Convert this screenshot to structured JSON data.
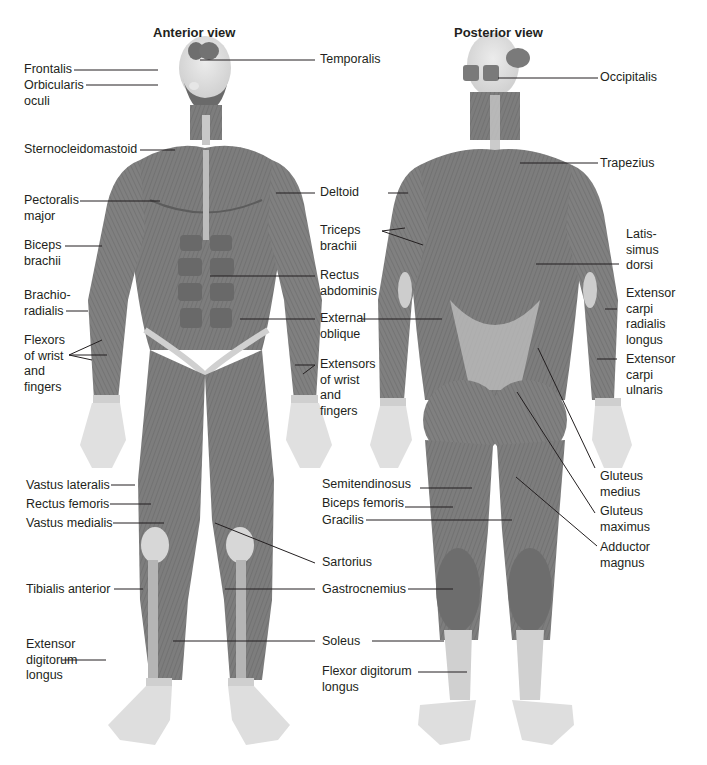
{
  "titles": {
    "anterior": "Anterior view",
    "posterior": "Posterior view"
  },
  "colors": {
    "muscle": "#7d7d7d",
    "muscle_dark": "#5e5e5e",
    "tendon": "#c9c9c9",
    "skin": "#e2e2e2",
    "text": "#231f20",
    "background": "#ffffff"
  },
  "anterior_labels": [
    {
      "id": "frontalis",
      "text": "Frontalis"
    },
    {
      "id": "orbicularis-oculi",
      "text": "Orbicularis\noculi"
    },
    {
      "id": "sternocleidomastoid",
      "text": "Sternocleidomastoid"
    },
    {
      "id": "pectoralis-major",
      "text": "Pectoralis\nmajor"
    },
    {
      "id": "biceps-brachii",
      "text": "Biceps\nbrachii"
    },
    {
      "id": "brachioradialis",
      "text": "Brachio-\nradialis"
    },
    {
      "id": "flexors-wrist-fingers",
      "text": "Flexors\nof wrist\nand\nfingers"
    },
    {
      "id": "vastus-lateralis",
      "text": "Vastus lateralis"
    },
    {
      "id": "rectus-femoris",
      "text": "Rectus femoris"
    },
    {
      "id": "vastus-medialis",
      "text": "Vastus medialis"
    },
    {
      "id": "tibialis-anterior",
      "text": "Tibialis anterior"
    },
    {
      "id": "extensor-digitorum-longus",
      "text": "Extensor\ndigitorum\nlongus"
    }
  ],
  "center_labels": [
    {
      "id": "temporalis",
      "text": "Temporalis"
    },
    {
      "id": "deltoid",
      "text": "Deltoid"
    },
    {
      "id": "triceps-brachii",
      "text": "Triceps\nbrachii"
    },
    {
      "id": "rectus-abdominis",
      "text": "Rectus\nabdominis"
    },
    {
      "id": "external-oblique",
      "text": "External\noblique"
    },
    {
      "id": "extensors-wrist-fingers",
      "text": "Extensors\nof wrist\nand\nfingers"
    },
    {
      "id": "semitendinosus",
      "text": "Semitendinosus"
    },
    {
      "id": "biceps-femoris",
      "text": "Biceps femoris"
    },
    {
      "id": "gracilis",
      "text": "Gracilis"
    },
    {
      "id": "sartorius",
      "text": "Sartorius"
    },
    {
      "id": "gastrocnemius",
      "text": "Gastrocnemius"
    },
    {
      "id": "soleus",
      "text": "Soleus"
    },
    {
      "id": "flexor-digitorum-longus",
      "text": "Flexor digitorum\nlongus"
    }
  ],
  "posterior_labels": [
    {
      "id": "occipitalis",
      "text": "Occipitalis"
    },
    {
      "id": "trapezius",
      "text": "Trapezius"
    },
    {
      "id": "latissimus-dorsi",
      "text": "Latis-\nsimus\ndorsi"
    },
    {
      "id": "extensor-carpi-radialis-longus",
      "text": "Extensor\ncarpi\nradialis\nlongus"
    },
    {
      "id": "extensor-carpi-ulnaris",
      "text": "Extensor\ncarpi\nulnaris"
    },
    {
      "id": "gluteus-medius",
      "text": "Gluteus\nmedius"
    },
    {
      "id": "gluteus-maximus",
      "text": "Gluteus\nmaximus"
    },
    {
      "id": "adductor-magnus",
      "text": "Adductor\nmagnus"
    }
  ]
}
